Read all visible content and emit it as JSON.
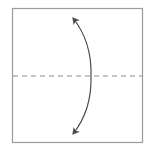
{
  "diagram": {
    "type": "origami-step",
    "paper_shape": "square",
    "fold_line": {
      "style": "dashed",
      "orientation": "horizontal",
      "kind": "valley-fold"
    },
    "arrow": {
      "style": "curved",
      "heads": "both",
      "meaning": "fold-and-unfold"
    },
    "colors": {
      "paper_edge": "#9a9a9a",
      "fold_line": "#8c8c8c",
      "arrow": "#4a4a4a",
      "background": "#ffffff"
    }
  }
}
